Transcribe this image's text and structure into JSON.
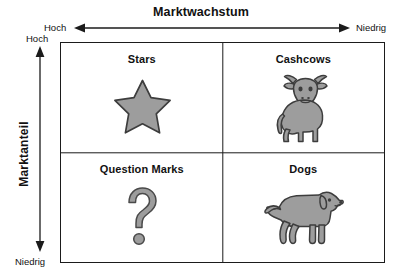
{
  "diagram": {
    "type": "bcg-matrix",
    "x_axis": {
      "title": "Marktwachstum",
      "left_label": "Hoch",
      "right_label": "Niedrig",
      "arrow": "double-headed-horizontal"
    },
    "y_axis": {
      "title": "Marktanteil",
      "top_label": "Hoch",
      "bottom_label": "Niedrig",
      "arrow": "double-headed-vertical"
    },
    "quadrants": [
      {
        "position": "top-left",
        "label": "Stars",
        "icon": "star-icon"
      },
      {
        "position": "top-right",
        "label": "Cashcows",
        "icon": "cow-icon"
      },
      {
        "position": "bottom-left",
        "label": "Question Marks",
        "icon": "question-mark-icon"
      },
      {
        "position": "bottom-right",
        "label": "Dogs",
        "icon": "dog-icon"
      }
    ],
    "colors": {
      "line": "#1b1b1b",
      "icon_fill": "#9a9a9a",
      "icon_stroke": "#3d3d3d",
      "background": "#ffffff",
      "text": "#111111"
    }
  }
}
